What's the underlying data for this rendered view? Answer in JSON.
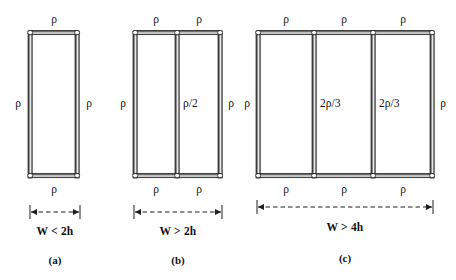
{
  "figure": {
    "type": "engineering-diagram",
    "background_color": "#ffffff",
    "ink_color": "#1a1a1a",
    "panels": [
      {
        "id": "a",
        "caption": "(a)",
        "condition": "W < 2h",
        "bays": 1,
        "top_labels": [
          "ρ"
        ],
        "bottom_labels": [
          "ρ"
        ],
        "left_label": "ρ",
        "right_label": "ρ",
        "interior_labels": []
      },
      {
        "id": "b",
        "caption": "(b)",
        "condition": "W > 2h",
        "bays": 2,
        "top_labels": [
          "ρ",
          "ρ"
        ],
        "bottom_labels": [
          "ρ",
          "ρ"
        ],
        "left_label": "ρ",
        "right_label": "ρ",
        "interior_labels": [
          "ρ/2"
        ]
      },
      {
        "id": "c",
        "caption": "(c)",
        "condition": "W > 4h",
        "bays": 3,
        "top_labels": [
          "ρ",
          "ρ",
          "ρ"
        ],
        "bottom_labels": [
          "ρ",
          "ρ",
          "ρ"
        ],
        "left_label": "ρ",
        "right_label": "ρ",
        "interior_labels": [
          "2ρ/3",
          "2ρ/3"
        ]
      }
    ]
  }
}
